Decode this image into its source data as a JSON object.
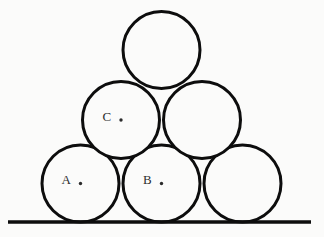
{
  "figure": {
    "background_color": "#fbfbfa",
    "stroke_color": "#0d0d0d",
    "label_color": "#2e2e2e",
    "stroke_width": 3,
    "canvas": {
      "width": 324,
      "height": 237
    }
  },
  "ground_line": {
    "name": "ground-line",
    "x1": 8,
    "y1": 222,
    "x2": 311,
    "y2": 222,
    "stroke_width": 3.4
  },
  "circles": [
    {
      "id": "bottom-left",
      "label": "A",
      "row": "bottom",
      "cx": 80.5,
      "cy": 183.5,
      "r": 38.5,
      "has_label": true,
      "has_center_dot": true,
      "label_dx": -14,
      "label_dy": -2
    },
    {
      "id": "bottom-middle",
      "label": "B",
      "row": "bottom",
      "cx": 161.5,
      "cy": 183.5,
      "r": 38.5,
      "has_label": true,
      "has_center_dot": true,
      "label_dx": -14,
      "label_dy": -2
    },
    {
      "id": "bottom-right",
      "label": "",
      "row": "bottom",
      "cx": 242.5,
      "cy": 183.5,
      "r": 38.5,
      "has_label": false,
      "has_center_dot": false,
      "label_dx": 0,
      "label_dy": 0
    },
    {
      "id": "middle-left",
      "label": "C",
      "row": "middle",
      "cx": 121,
      "cy": 120,
      "r": 38.5,
      "has_label": true,
      "has_center_dot": true,
      "label_dx": -14,
      "label_dy": -2
    },
    {
      "id": "middle-right",
      "label": "",
      "row": "middle",
      "cx": 202,
      "cy": 120,
      "r": 38.5,
      "has_label": false,
      "has_center_dot": false,
      "label_dx": 0,
      "label_dy": 0
    },
    {
      "id": "top",
      "label": "",
      "row": "top",
      "cx": 161.5,
      "cy": 50,
      "r": 38.5,
      "has_label": false,
      "has_center_dot": false,
      "label_dx": 0,
      "label_dy": 0
    }
  ],
  "center_dot_radius": 1.7
}
